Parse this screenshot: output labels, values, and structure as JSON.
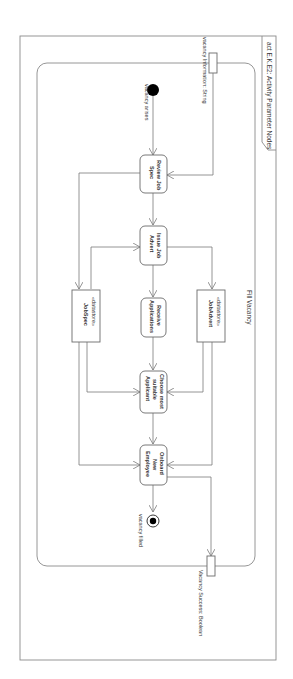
{
  "diagram": {
    "frame_title": "act E.K.E2: Activity Parameter Nodes",
    "activity_name": "Fill Vacancy",
    "input_parameter": "vacancy Information: String",
    "output_parameter": "Vacancy Success: Boolean",
    "initial_label": "vacancy arises",
    "final_label": "vacancy filled",
    "actions": [
      {
        "id": "review",
        "label_line1": "Review Job",
        "label_line2": "Spec"
      },
      {
        "id": "issue",
        "label_line1": "Issue Job",
        "label_line2": "Advert"
      },
      {
        "id": "receive",
        "label_line1": "Receive",
        "label_line2": "Applications"
      },
      {
        "id": "choose",
        "label_line1": "Choose most",
        "label_line2": "suitable",
        "label_line3": "Applicant"
      },
      {
        "id": "onboard",
        "label_line1": "Onboard",
        "label_line2": "New",
        "label_line3": "Employee"
      }
    ],
    "datastores": [
      {
        "id": "jobspec",
        "stereotype": "«datastore»",
        "name": "JobSpec"
      },
      {
        "id": "jobadvert",
        "stereotype": "«datastore»",
        "name": "JobAdvert"
      }
    ],
    "colors": {
      "line": "#7a7a7a",
      "node_fill": "#ffffff",
      "initial": "#000000"
    }
  }
}
